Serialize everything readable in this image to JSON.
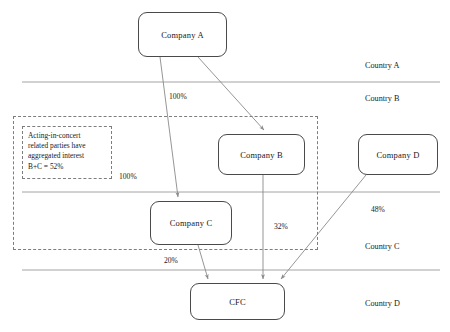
{
  "diagram": {
    "nodes": [
      {
        "id": "company-a",
        "label": "Company A"
      },
      {
        "id": "company-b",
        "label": "Company B"
      },
      {
        "id": "company-c",
        "label": "Company C"
      },
      {
        "id": "company-d",
        "label": "Company D"
      },
      {
        "id": "cfc",
        "label": "CFC"
      }
    ],
    "country_bands": [
      {
        "id": "country-a",
        "label": "Country A"
      },
      {
        "id": "country-b",
        "label": "Country B"
      },
      {
        "id": "country-c",
        "label": "Country C"
      },
      {
        "id": "country-d",
        "label": "Country D"
      }
    ],
    "edges": [
      {
        "id": "a-to-b",
        "from": "Company A",
        "to": "Company B",
        "label": "100%"
      },
      {
        "id": "a-to-c",
        "from": "Company A",
        "to": "Company C",
        "label": "100%"
      },
      {
        "id": "b-to-cfc",
        "from": "Company B",
        "to": "CFC",
        "label": "32%"
      },
      {
        "id": "c-to-cfc",
        "from": "Company C",
        "to": "CFC",
        "label": "20%"
      },
      {
        "id": "d-to-cfc",
        "from": "Company D",
        "to": "CFC",
        "label": "48%"
      }
    ],
    "annotation": {
      "id": "acting-in-concert-note",
      "lines": [
        "Acting-in-concert",
        "related parties have",
        "aggregated  interest",
        "B+C = 52%"
      ]
    },
    "colors": {
      "node_border": "#4a4a4a",
      "dashed_border": "#7d7d7d",
      "connector": "#8a8a8a",
      "divider": "#9a9a9a",
      "text": "#1a1a1a",
      "background": "#ffffff"
    }
  }
}
